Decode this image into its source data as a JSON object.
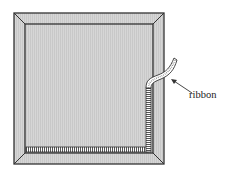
{
  "diagram": {
    "labels": {
      "ribbon": "ribbon"
    },
    "colors": {
      "frame_fill": "#d9d9d9",
      "panel_fill": "#cfcfcf",
      "stroke": "#333333",
      "background": "#ffffff",
      "ribbon_fill": "#ffffff"
    }
  }
}
